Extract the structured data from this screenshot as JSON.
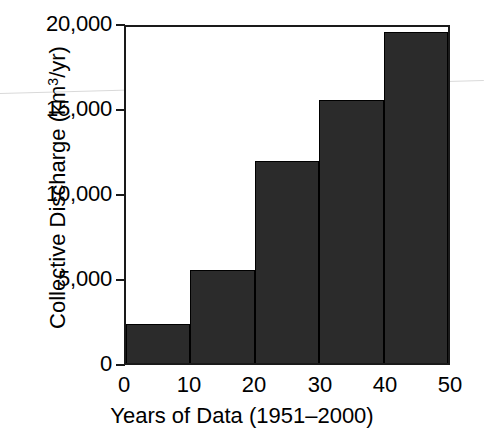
{
  "chart_data": {
    "type": "bar",
    "title": "",
    "subtitle": "",
    "xlabel": "Years of Data (1951–2000)",
    "ylabel": "Collective Discharge (km3/yr)",
    "ylabel_base": "Collective Discharge (km",
    "ylabel_sup": "3",
    "ylabel_tail": "/yr)",
    "categories": [
      "0–10",
      "10–20",
      "20–30",
      "30–40",
      "40–50"
    ],
    "bin_edges": [
      0,
      10,
      20,
      30,
      40,
      50
    ],
    "values": [
      2300,
      5530,
      12000,
      15650,
      19700
    ],
    "xlim": [
      0,
      50
    ],
    "ylim": [
      0,
      20000
    ],
    "xticks": [
      0,
      10,
      20,
      30,
      40,
      50
    ],
    "xtick_labels": [
      "0",
      "10",
      "20",
      "30",
      "40",
      "50"
    ],
    "yticks": [
      0,
      5000,
      10000,
      15000,
      20000
    ],
    "ytick_labels": [
      "0",
      "5,000",
      "10,000",
      "15,000",
      "20,000"
    ],
    "grid": false,
    "legend": null,
    "bar_color": "#2b2b2b",
    "bar_edge_color": "#000000",
    "axis_color": "#1a1a1a",
    "background": "#ffffff",
    "annotations": []
  }
}
